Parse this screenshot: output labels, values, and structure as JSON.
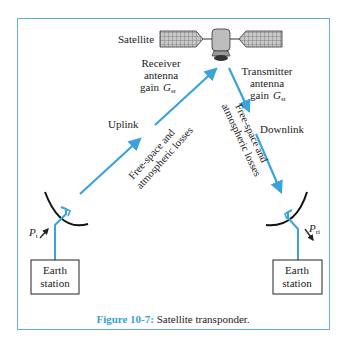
{
  "figure": {
    "satellite_label": "Satellite",
    "receiver": {
      "line1": "Receiver",
      "line2": "antenna",
      "line3": "gain",
      "symbol": "G",
      "subscript": "sr"
    },
    "transmitter": {
      "line1": "Transmitter",
      "line2": "antenna",
      "line3": "gain",
      "symbol": "G",
      "subscript": "st"
    },
    "uplink_label": "Uplink",
    "downlink_label": "Downlink",
    "uplink_losses": {
      "line1": "Free-space and",
      "line2": "atmospheric losses"
    },
    "downlink_losses": {
      "line1": "Free-space and",
      "line2": "atmospheric losses"
    },
    "left_power": {
      "symbol": "P",
      "subscript": "t"
    },
    "right_power": {
      "symbol": "P",
      "subscript": "ri"
    },
    "left_station": {
      "line1": "Earth",
      "line2": "station"
    },
    "right_station": {
      "line1": "Earth",
      "line2": "station"
    }
  },
  "caption": {
    "number": "Figure 10-7:",
    "text": " Satellite transponder."
  },
  "colors": {
    "accent": "#3a9fd6",
    "frame": "#5fb0dc",
    "beam": "#3aa3dc"
  }
}
